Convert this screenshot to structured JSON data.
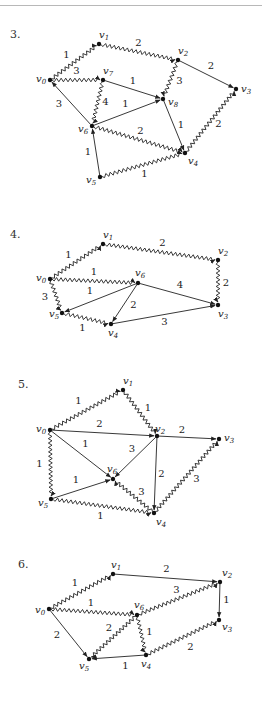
{
  "colors": {
    "ink": "#222222",
    "background": "#ffffff",
    "rule": "#b8b8b8"
  },
  "diagrams": [
    {
      "number": "3.",
      "number_pos": [
        10,
        38
      ],
      "nodes": {
        "v0": {
          "label": "v",
          "sub": "0",
          "x": 50,
          "y": 80,
          "lx": -14,
          "ly": 2
        },
        "v1": {
          "label": "v",
          "sub": "1",
          "x": 99,
          "y": 44,
          "lx": 0,
          "ly": -6
        },
        "v2": {
          "label": "v",
          "sub": "2",
          "x": 178,
          "y": 60,
          "lx": 0,
          "ly": -6
        },
        "v3": {
          "label": "v",
          "sub": "3",
          "x": 236,
          "y": 89,
          "lx": 5,
          "ly": 3
        },
        "v7": {
          "label": "v",
          "sub": "7",
          "x": 103,
          "y": 80,
          "lx": 0,
          "ly": -6
        },
        "v8": {
          "label": "v",
          "sub": "8",
          "x": 163,
          "y": 99,
          "lx": 5,
          "ly": 6
        },
        "v6": {
          "label": "v",
          "sub": "6",
          "x": 92,
          "y": 126,
          "lx": -14,
          "ly": 6
        },
        "v4": {
          "label": "v",
          "sub": "4",
          "x": 185,
          "y": 153,
          "lx": 3,
          "ly": 11
        },
        "v5": {
          "label": "v",
          "sub": "5",
          "x": 100,
          "y": 177,
          "lx": -14,
          "ly": 6
        }
      },
      "edges": [
        {
          "from": "v0",
          "to": "v1",
          "weight": "1",
          "wavy": true,
          "lx": -8,
          "ly": -4
        },
        {
          "from": "v1",
          "to": "v2",
          "weight": "2",
          "wavy": true,
          "lx": 0,
          "ly": -6
        },
        {
          "from": "v2",
          "to": "v3",
          "weight": "2",
          "wavy": false,
          "lx": 4,
          "ly": -6
        },
        {
          "from": "v0",
          "to": "v7",
          "weight": "3",
          "wavy": true,
          "lx": 0,
          "ly": -6
        },
        {
          "from": "v7",
          "to": "v8",
          "weight": "1",
          "wavy": false,
          "lx": 0,
          "ly": -6
        },
        {
          "from": "v2",
          "to": "v8",
          "weight": "3",
          "wavy": true,
          "lx": 9,
          "ly": 4
        },
        {
          "from": "v7",
          "to": "v6",
          "weight": "4",
          "wavy": true,
          "lx": 8,
          "ly": 2
        },
        {
          "from": "v6",
          "to": "v0",
          "weight": "3",
          "wavy": false,
          "lx": -12,
          "ly": 4
        },
        {
          "from": "v6",
          "to": "v8",
          "weight": "1",
          "wavy": false,
          "lx": -2,
          "ly": -6
        },
        {
          "from": "v8",
          "to": "v4",
          "weight": "1",
          "wavy": false,
          "lx": 7,
          "ly": 2
        },
        {
          "from": "v6",
          "to": "v4",
          "weight": "2",
          "wavy": true,
          "lx": 2,
          "ly": -6
        },
        {
          "from": "v4",
          "to": "v3",
          "weight": "2",
          "wavy": true,
          "lx": 8,
          "ly": 6
        },
        {
          "from": "v5",
          "to": "v6",
          "weight": "1",
          "wavy": false,
          "lx": -8,
          "ly": 3
        },
        {
          "from": "v5",
          "to": "v4",
          "weight": "1",
          "wavy": true,
          "lx": 2,
          "ly": 12
        }
      ]
    },
    {
      "number": "4.",
      "number_pos": [
        10,
        238
      ],
      "nodes": {
        "v0": {
          "label": "v",
          "sub": "0",
          "x": 50,
          "y": 279,
          "lx": -14,
          "ly": 2
        },
        "v1": {
          "label": "v",
          "sub": "1",
          "x": 103,
          "y": 244,
          "lx": 0,
          "ly": -6
        },
        "v2": {
          "label": "v",
          "sub": "2",
          "x": 218,
          "y": 260,
          "lx": 0,
          "ly": -6
        },
        "v6": {
          "label": "v",
          "sub": "6",
          "x": 138,
          "y": 283,
          "lx": -3,
          "ly": -7
        },
        "v3": {
          "label": "v",
          "sub": "3",
          "x": 218,
          "y": 305,
          "lx": 0,
          "ly": 12
        },
        "v5": {
          "label": "v",
          "sub": "5",
          "x": 62,
          "y": 313,
          "lx": -13,
          "ly": 4
        },
        "v4": {
          "label": "v",
          "sub": "4",
          "x": 111,
          "y": 324,
          "lx": -3,
          "ly": 12
        }
      },
      "edges": [
        {
          "from": "v0",
          "to": "v1",
          "weight": "1",
          "wavy": true,
          "lx": -8,
          "ly": -4
        },
        {
          "from": "v1",
          "to": "v2",
          "weight": "2",
          "wavy": true,
          "lx": 2,
          "ly": -6
        },
        {
          "from": "v2",
          "to": "v3",
          "weight": "2",
          "wavy": true,
          "lx": 8,
          "ly": 3
        },
        {
          "from": "v0",
          "to": "v6",
          "weight": "1",
          "wavy": true,
          "lx": 0,
          "ly": -6
        },
        {
          "from": "v6",
          "to": "v3",
          "weight": "4",
          "wavy": false,
          "lx": 2,
          "ly": -6
        },
        {
          "from": "v6",
          "to": "v5",
          "weight": "1",
          "wavy": false,
          "lx": -10,
          "ly": -4
        },
        {
          "from": "v6",
          "to": "v4",
          "weight": "2",
          "wavy": false,
          "lx": 9,
          "ly": 4
        },
        {
          "from": "v0",
          "to": "v5",
          "weight": "3",
          "wavy": true,
          "lx": -11,
          "ly": 4
        },
        {
          "from": "v5",
          "to": "v4",
          "weight": "1",
          "wavy": true,
          "lx": -4,
          "ly": 12
        },
        {
          "from": "v4",
          "to": "v3",
          "weight": "3",
          "wavy": false,
          "lx": 0,
          "ly": 10
        }
      ]
    },
    {
      "number": "5.",
      "number_pos": [
        18,
        388
      ],
      "nodes": {
        "v1": {
          "label": "v",
          "sub": "1",
          "x": 123,
          "y": 390,
          "lx": 0,
          "ly": -6
        },
        "v0": {
          "label": "v",
          "sub": "0",
          "x": 50,
          "y": 430,
          "lx": -14,
          "ly": 2
        },
        "v2": {
          "label": "v",
          "sub": "2",
          "x": 157,
          "y": 436,
          "lx": -2,
          "ly": -4
        },
        "v3": {
          "label": "v",
          "sub": "3",
          "x": 219,
          "y": 439,
          "lx": 5,
          "ly": 2
        },
        "v6": {
          "label": "v",
          "sub": "6",
          "x": 113,
          "y": 479,
          "lx": -6,
          "ly": -7
        },
        "v5": {
          "label": "v",
          "sub": "5",
          "x": 51,
          "y": 499,
          "lx": -13,
          "ly": 7
        },
        "v4": {
          "label": "v",
          "sub": "4",
          "x": 154,
          "y": 513,
          "lx": 2,
          "ly": 12
        }
      },
      "edges": [
        {
          "from": "v0",
          "to": "v1",
          "weight": "1",
          "wavy": true,
          "lx": -8,
          "ly": -6
        },
        {
          "from": "v1",
          "to": "v2",
          "weight": "1",
          "wavy": true,
          "lx": 8,
          "ly": -2
        },
        {
          "from": "v0",
          "to": "v2",
          "weight": "2",
          "wavy": false,
          "lx": -4,
          "ly": -6
        },
        {
          "from": "v2",
          "to": "v3",
          "weight": "2",
          "wavy": false,
          "lx": -6,
          "ly": -5
        },
        {
          "from": "v0",
          "to": "v6",
          "weight": "1",
          "wavy": false,
          "lx": 4,
          "ly": -8
        },
        {
          "from": "v2",
          "to": "v6",
          "weight": "3",
          "wavy": false,
          "lx": -3,
          "ly": -6
        },
        {
          "from": "v2",
          "to": "v4",
          "weight": "2",
          "wavy": false,
          "lx": 6,
          "ly": 2
        },
        {
          "from": "v0",
          "to": "v5",
          "weight": "1",
          "wavy": true,
          "lx": -11,
          "ly": 2
        },
        {
          "from": "v5",
          "to": "v6",
          "weight": "1",
          "wavy": false,
          "lx": -6,
          "ly": -6
        },
        {
          "from": "v4",
          "to": "v6",
          "weight": "3",
          "wavy": true,
          "lx": 8,
          "ly": -1
        },
        {
          "from": "v5",
          "to": "v4",
          "weight": "1",
          "wavy": true,
          "lx": -2,
          "ly": 13
        },
        {
          "from": "v4",
          "to": "v3",
          "weight": "3",
          "wavy": true,
          "lx": 10,
          "ly": 6
        }
      ]
    },
    {
      "number": "6.",
      "number_pos": [
        18,
        568
      ],
      "nodes": {
        "v1": {
          "label": "v",
          "sub": "1",
          "x": 113,
          "y": 574,
          "lx": -2,
          "ly": -6
        },
        "v0": {
          "label": "v",
          "sub": "0",
          "x": 49,
          "y": 609,
          "lx": -14,
          "ly": 4
        },
        "v2": {
          "label": "v",
          "sub": "2",
          "x": 220,
          "y": 582,
          "lx": 2,
          "ly": -6
        },
        "v6": {
          "label": "v",
          "sub": "6",
          "x": 137,
          "y": 615,
          "lx": -3,
          "ly": -7
        },
        "v3": {
          "label": "v",
          "sub": "3",
          "x": 219,
          "y": 620,
          "lx": 3,
          "ly": 10
        },
        "v5": {
          "label": "v",
          "sub": "5",
          "x": 89,
          "y": 659,
          "lx": -10,
          "ly": 10
        },
        "v4": {
          "label": "v",
          "sub": "4",
          "x": 146,
          "y": 655,
          "lx": -5,
          "ly": 12
        }
      },
      "edges": [
        {
          "from": "v0",
          "to": "v1",
          "weight": "1",
          "wavy": true,
          "lx": -6,
          "ly": -6
        },
        {
          "from": "v1",
          "to": "v2",
          "weight": "2",
          "wavy": false,
          "lx": 0,
          "ly": -6
        },
        {
          "from": "v2",
          "to": "v3",
          "weight": "1",
          "wavy": false,
          "lx": 7,
          "ly": 2
        },
        {
          "from": "v0",
          "to": "v6",
          "weight": "1",
          "wavy": true,
          "lx": -2,
          "ly": -6
        },
        {
          "from": "v6",
          "to": "v2",
          "weight": "3",
          "wavy": true,
          "lx": -2,
          "ly": -6
        },
        {
          "from": "v0",
          "to": "v5",
          "weight": "2",
          "wavy": false,
          "lx": -12,
          "ly": 4
        },
        {
          "from": "v6",
          "to": "v5",
          "weight": "2",
          "wavy": true,
          "lx": -4,
          "ly": -6
        },
        {
          "from": "v6",
          "to": "v4",
          "weight": "1",
          "wavy": true,
          "lx": 8,
          "ly": 0
        },
        {
          "from": "v4",
          "to": "v5",
          "weight": "1",
          "wavy": false,
          "lx": 8,
          "ly": 12
        },
        {
          "from": "v4",
          "to": "v3",
          "weight": "2",
          "wavy": true,
          "lx": 8,
          "ly": 12
        }
      ]
    }
  ]
}
